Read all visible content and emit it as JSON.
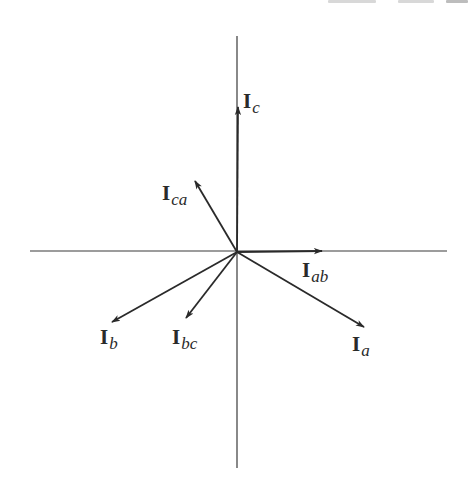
{
  "diagram": {
    "type": "phasor-diagram",
    "origin": [
      237,
      252
    ],
    "axes": {
      "horizontal": {
        "x1": 30,
        "y1": 251,
        "x2": 447,
        "y2": 251
      },
      "vertical": {
        "x1": 237,
        "y1": 36,
        "x2": 237,
        "y2": 468
      }
    },
    "line_color": "#2a2a2a",
    "axis_color": "#3a3a3a",
    "phasors": [
      {
        "id": "Ic",
        "main": "I",
        "sub": "c",
        "tip": [
          238,
          107
        ],
        "label_pos": [
          243,
          91
        ]
      },
      {
        "id": "Ica",
        "main": "I",
        "sub": "ca",
        "tip": [
          195,
          181
        ],
        "label_pos": [
          162,
          183
        ]
      },
      {
        "id": "Iab",
        "main": "I",
        "sub": "ab",
        "tip": [
          322,
          251
        ],
        "label_pos": [
          302,
          260
        ]
      },
      {
        "id": "Ia",
        "main": "I",
        "sub": "a",
        "tip": [
          364,
          327
        ],
        "label_pos": [
          352,
          334
        ]
      },
      {
        "id": "Ib",
        "main": "I",
        "sub": "b",
        "tip": [
          112,
          322
        ],
        "label_pos": [
          100,
          327
        ]
      },
      {
        "id": "Ibc",
        "main": "I",
        "sub": "bc",
        "tip": [
          186,
          318
        ],
        "label_pos": [
          172,
          327
        ]
      }
    ]
  }
}
